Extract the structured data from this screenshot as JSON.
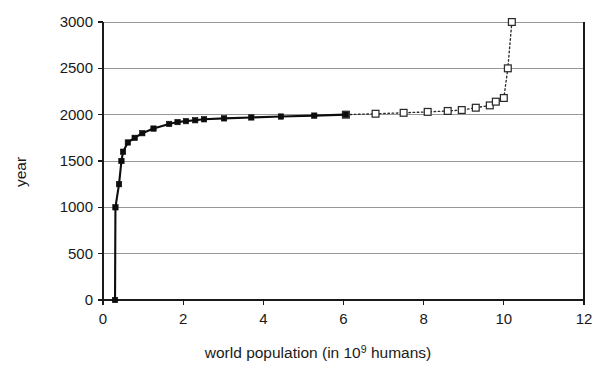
{
  "chart_data": {
    "type": "line",
    "title": "",
    "xlabel": "world population (in 10^9 humans)",
    "xlabel_parts": {
      "before": "world population (in 10",
      "superscript": "9",
      "after": " humans)"
    },
    "ylabel": "year",
    "xlim": [
      0,
      12
    ],
    "ylim": [
      0,
      3000
    ],
    "xticks": [
      0,
      2,
      4,
      6,
      8,
      10,
      12
    ],
    "yticks": [
      0,
      500,
      1000,
      1500,
      2000,
      2500,
      3000
    ],
    "xtick_labels": [
      "0",
      "2",
      "4",
      "6",
      "8",
      "10",
      "12"
    ],
    "ytick_labels": [
      "0",
      "500",
      "1000",
      "1500",
      "2000",
      "2500",
      "3000"
    ],
    "grid": "horizontal",
    "legend": "none",
    "axis_note": "x = world population in billions, y = year (year plotted on vertical axis)",
    "series": [
      {
        "name": "historical",
        "style": "solid line with filled square markers",
        "color": "#0d0d0d",
        "marker": "filled-square",
        "points": [
          {
            "population": 0.3,
            "year": 0
          },
          {
            "population": 0.31,
            "year": 1000
          },
          {
            "population": 0.4,
            "year": 1250
          },
          {
            "population": 0.46,
            "year": 1500
          },
          {
            "population": 0.5,
            "year": 1600
          },
          {
            "population": 0.62,
            "year": 1700
          },
          {
            "population": 0.79,
            "year": 1750
          },
          {
            "population": 0.98,
            "year": 1800
          },
          {
            "population": 1.26,
            "year": 1850
          },
          {
            "population": 1.65,
            "year": 1900
          },
          {
            "population": 1.86,
            "year": 1920
          },
          {
            "population": 2.07,
            "year": 1930
          },
          {
            "population": 2.3,
            "year": 1940
          },
          {
            "population": 2.52,
            "year": 1950
          },
          {
            "population": 3.02,
            "year": 1960
          },
          {
            "population": 3.7,
            "year": 1970
          },
          {
            "population": 4.44,
            "year": 1980
          },
          {
            "population": 5.27,
            "year": 1990
          },
          {
            "population": 6.06,
            "year": 2000
          }
        ]
      },
      {
        "name": "projection",
        "style": "dotted line with hollow square markers",
        "color": "#2b2b2b",
        "marker": "hollow-square",
        "points": [
          {
            "population": 6.06,
            "year": 2000
          },
          {
            "population": 6.8,
            "year": 2010
          },
          {
            "population": 7.5,
            "year": 2020
          },
          {
            "population": 8.1,
            "year": 2030
          },
          {
            "population": 8.6,
            "year": 2040
          },
          {
            "population": 8.95,
            "year": 2050
          },
          {
            "population": 9.3,
            "year": 2075
          },
          {
            "population": 9.65,
            "year": 2100
          },
          {
            "population": 9.8,
            "year": 2140
          },
          {
            "population": 10.0,
            "year": 2180
          },
          {
            "population": 10.1,
            "year": 2500
          },
          {
            "population": 10.2,
            "year": 3000
          }
        ]
      }
    ]
  },
  "figure": {
    "background_color": "#ffffff",
    "grid_color": "#8c8c8c",
    "axis_color": "#1a1a1a"
  }
}
